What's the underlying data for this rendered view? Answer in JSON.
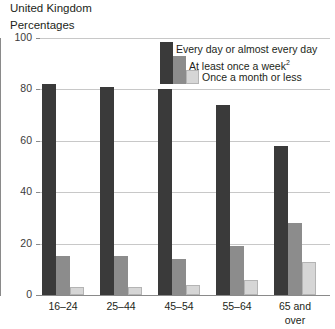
{
  "header": {
    "title": "United Kingdom",
    "subtitle": "Percentages"
  },
  "legend": {
    "items": [
      {
        "label": "Every day or almost every day",
        "color": "#3a3a3a",
        "footnote": ""
      },
      {
        "label": "At least once a week",
        "color": "#8c8c8c",
        "footnote": "2"
      },
      {
        "label": "Once a month or less",
        "color": "#d6d6d6",
        "footnote": ""
      }
    ]
  },
  "axis": {
    "y_ticks": [
      "0",
      "20",
      "40",
      "60",
      "80",
      "100"
    ],
    "x_labels": [
      [
        "16–24"
      ],
      [
        "25–44"
      ],
      [
        "45–54"
      ],
      [
        "55–64"
      ],
      [
        "65 and",
        "over"
      ]
    ]
  },
  "chart_data": {
    "type": "bar",
    "title": "United Kingdom",
    "subtitle": "Percentages",
    "xlabel": "",
    "ylabel": "Percentages",
    "ylim": [
      0,
      100
    ],
    "yticks": [
      0,
      20,
      40,
      60,
      80,
      100
    ],
    "grid": true,
    "legend_position": "top-right",
    "categories": [
      "16–24",
      "25–44",
      "45–54",
      "55–64",
      "65 and over"
    ],
    "series": [
      {
        "name": "Every day or almost every day",
        "color": "#3a3a3a",
        "values": [
          82,
          81,
          80,
          74,
          58
        ]
      },
      {
        "name": "At least once a week",
        "color": "#8c8c8c",
        "values": [
          15,
          15,
          14,
          19,
          28
        ]
      },
      {
        "name": "Once a month or less",
        "color": "#d6d6d6",
        "values": [
          3,
          3,
          4,
          6,
          13
        ]
      }
    ]
  }
}
